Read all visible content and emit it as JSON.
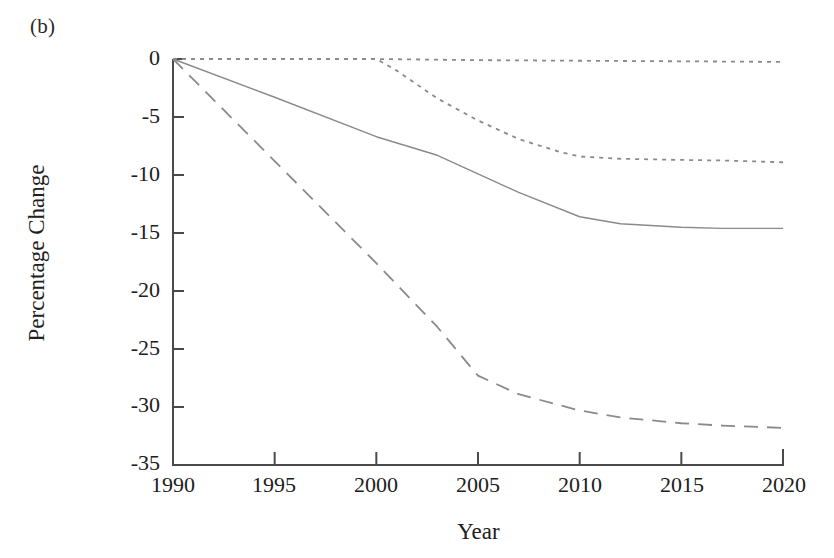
{
  "figure": {
    "panel_label": "(b)"
  },
  "chart_data": {
    "type": "line",
    "title": "",
    "subtitle": "",
    "xlabel": "Year",
    "ylabel": "Percentage Change",
    "xlim": [
      1990,
      2020
    ],
    "ylim": [
      -35,
      0
    ],
    "xticks": [
      "1990",
      "1995",
      "2000",
      "2005",
      "2010",
      "2015",
      "2020"
    ],
    "yticks": [
      "0",
      "-5",
      "-10",
      "-15",
      "-20",
      "-25",
      "-30",
      "-35"
    ],
    "xtick_values": [
      1990,
      1995,
      2000,
      2005,
      2010,
      2015,
      2020
    ],
    "ytick_values": [
      0,
      -5,
      -10,
      -15,
      -20,
      -25,
      -30,
      -35
    ],
    "grid": false,
    "legend": "none",
    "line_color": "#8a8a8a",
    "axis_color": "#4a4a4a",
    "series": [
      {
        "name": "baseline-flat",
        "style": "dotted",
        "x": [
          1990,
          1995,
          2000,
          2005,
          2010,
          2015,
          2020
        ],
        "values": [
          0,
          0,
          0,
          -0.1,
          -0.15,
          -0.2,
          -0.25
        ]
      },
      {
        "name": "scenario-dotted-declining",
        "style": "dotted",
        "x": [
          1990,
          1995,
          2000,
          2001,
          2003,
          2005,
          2007,
          2009,
          2010,
          2012,
          2015,
          2017,
          2020
        ],
        "values": [
          0,
          0,
          0,
          -1.0,
          -3.4,
          -5.3,
          -6.9,
          -8.0,
          -8.4,
          -8.6,
          -8.7,
          -8.75,
          -8.9
        ]
      },
      {
        "name": "scenario-solid",
        "style": "solid",
        "x": [
          1990,
          1995,
          2000,
          2003,
          2005,
          2007,
          2010,
          2012,
          2015,
          2017,
          2020
        ],
        "values": [
          0,
          -3.3,
          -6.7,
          -8.3,
          -9.9,
          -11.5,
          -13.6,
          -14.2,
          -14.5,
          -14.6,
          -14.6
        ]
      },
      {
        "name": "scenario-dashed",
        "style": "dashed",
        "x": [
          1990,
          1995,
          2000,
          2003,
          2005,
          2007,
          2010,
          2012,
          2015,
          2017,
          2020
        ],
        "values": [
          0,
          -8.8,
          -17.6,
          -23.1,
          -27.3,
          -28.9,
          -30.3,
          -30.9,
          -31.4,
          -31.6,
          -31.8
        ]
      }
    ]
  }
}
